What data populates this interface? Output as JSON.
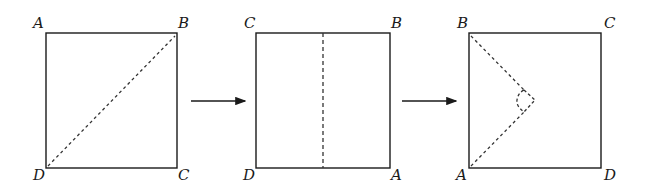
{
  "diagram": {
    "stroke_color": "#1a1a1a",
    "panels": [
      {
        "id": "step-1",
        "corners": {
          "top_left": "A",
          "top_right": "B",
          "bottom_left": "D",
          "bottom_right": "C"
        },
        "fold_line": "diagonal from D to B (dashed)"
      },
      {
        "id": "step-2",
        "corners": {
          "top_left": "C",
          "top_right": "B",
          "bottom_left": "D",
          "bottom_right": "A"
        },
        "fold_line": "vertical center line (dashed)"
      },
      {
        "id": "step-3",
        "corners": {
          "top_left": "B",
          "top_right": "C",
          "bottom_left": "A",
          "bottom_right": "D"
        },
        "fold_line": "dashed lines from B and A meeting at a point with small dashed circle"
      }
    ],
    "arrows": [
      {
        "from": "step-1",
        "to": "step-2"
      },
      {
        "from": "step-2",
        "to": "step-3"
      }
    ]
  }
}
